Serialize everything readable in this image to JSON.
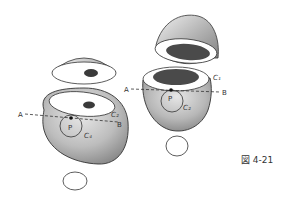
{
  "figure": {
    "caption": "図 4-21",
    "left_figure": {
      "labels": {
        "A": "A",
        "B": "B",
        "P": "P",
        "rim_curve": "C₂",
        "circle": "C₄"
      }
    },
    "right_figure": {
      "labels": {
        "A": "A",
        "B": "B",
        "P": "P",
        "rim_curve": "C₁",
        "circle": "C₂"
      }
    },
    "colors": {
      "outline": "#333333",
      "shade_dark": "#555555",
      "shade_light": "#d8d8d8",
      "background": "#ffffff"
    }
  }
}
